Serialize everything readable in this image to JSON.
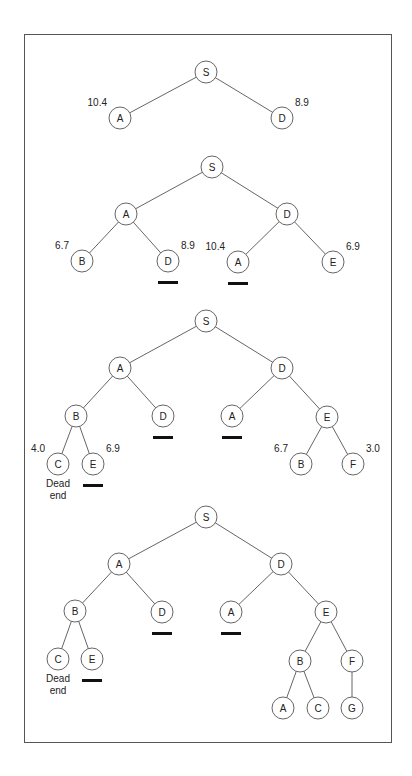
{
  "diagram": {
    "title": "",
    "frame": {
      "x": 24,
      "y": 34,
      "width": 368,
      "height": 709
    },
    "node_radius": 11,
    "trees": [
      {
        "id": "step-1",
        "nodes": [
          {
            "id": "t1-S",
            "label": "S",
            "x": 206,
            "y": 72
          },
          {
            "id": "t1-A",
            "label": "A",
            "x": 120,
            "y": 118,
            "cost": "10.4",
            "cost_side": "left"
          },
          {
            "id": "t1-D",
            "label": "D",
            "x": 282,
            "y": 118,
            "cost": "8.9",
            "cost_side": "right"
          }
        ],
        "edges": [
          [
            "t1-S",
            "t1-A"
          ],
          [
            "t1-S",
            "t1-D"
          ]
        ],
        "underlined": [],
        "notes": []
      },
      {
        "id": "step-2",
        "nodes": [
          {
            "id": "t2-S",
            "label": "S",
            "x": 212,
            "y": 167
          },
          {
            "id": "t2-A",
            "label": "A",
            "x": 126,
            "y": 214
          },
          {
            "id": "t2-D",
            "label": "D",
            "x": 287,
            "y": 214
          },
          {
            "id": "t2-AB",
            "label": "B",
            "x": 82,
            "y": 261,
            "cost": "6.7",
            "cost_side": "left"
          },
          {
            "id": "t2-AD",
            "label": "D",
            "x": 168,
            "y": 261,
            "cost": "8.9",
            "cost_side": "right"
          },
          {
            "id": "t2-DA",
            "label": "A",
            "x": 238,
            "y": 262,
            "cost": "10.4",
            "cost_side": "left"
          },
          {
            "id": "t2-DE",
            "label": "E",
            "x": 333,
            "y": 262,
            "cost": "6.9",
            "cost_side": "right"
          }
        ],
        "edges": [
          [
            "t2-S",
            "t2-A"
          ],
          [
            "t2-S",
            "t2-D"
          ],
          [
            "t2-A",
            "t2-AB"
          ],
          [
            "t2-A",
            "t2-AD"
          ],
          [
            "t2-D",
            "t2-DA"
          ],
          [
            "t2-D",
            "t2-DE"
          ]
        ],
        "underlined": [
          "t2-AD",
          "t2-DA"
        ],
        "notes": []
      },
      {
        "id": "step-3",
        "nodes": [
          {
            "id": "t3-S",
            "label": "S",
            "x": 206,
            "y": 321
          },
          {
            "id": "t3-A",
            "label": "A",
            "x": 120,
            "y": 368
          },
          {
            "id": "t3-D",
            "label": "D",
            "x": 282,
            "y": 368
          },
          {
            "id": "t3-AB",
            "label": "B",
            "x": 76,
            "y": 416
          },
          {
            "id": "t3-AD",
            "label": "D",
            "x": 163,
            "y": 416
          },
          {
            "id": "t3-DA",
            "label": "A",
            "x": 232,
            "y": 416
          },
          {
            "id": "t3-DE",
            "label": "E",
            "x": 327,
            "y": 417
          },
          {
            "id": "t3-ABC",
            "label": "C",
            "x": 58,
            "y": 464,
            "cost": "4.0",
            "cost_side": "left"
          },
          {
            "id": "t3-ABE",
            "label": "E",
            "x": 93,
            "y": 464,
            "cost": "6.9",
            "cost_side": "right"
          },
          {
            "id": "t3-DEB",
            "label": "B",
            "x": 301,
            "y": 464,
            "cost": "6.7",
            "cost_side": "left"
          },
          {
            "id": "t3-DEF",
            "label": "F",
            "x": 353,
            "y": 464,
            "cost": "3.0",
            "cost_side": "right"
          }
        ],
        "edges": [
          [
            "t3-S",
            "t3-A"
          ],
          [
            "t3-S",
            "t3-D"
          ],
          [
            "t3-A",
            "t3-AB"
          ],
          [
            "t3-A",
            "t3-AD"
          ],
          [
            "t3-D",
            "t3-DA"
          ],
          [
            "t3-D",
            "t3-DE"
          ],
          [
            "t3-AB",
            "t3-ABC"
          ],
          [
            "t3-AB",
            "t3-ABE"
          ],
          [
            "t3-DE",
            "t3-DEB"
          ],
          [
            "t3-DE",
            "t3-DEF"
          ]
        ],
        "underlined": [
          "t3-AD",
          "t3-DA",
          "t3-ABE"
        ],
        "notes": [
          {
            "node": "t3-ABC",
            "lines": [
              "Dead",
              "end"
            ]
          }
        ]
      },
      {
        "id": "step-4",
        "nodes": [
          {
            "id": "t4-S",
            "label": "S",
            "x": 206,
            "y": 517
          },
          {
            "id": "t4-A",
            "label": "A",
            "x": 119,
            "y": 564
          },
          {
            "id": "t4-D",
            "label": "D",
            "x": 281,
            "y": 564
          },
          {
            "id": "t4-AB",
            "label": "B",
            "x": 75,
            "y": 611
          },
          {
            "id": "t4-AD",
            "label": "D",
            "x": 162,
            "y": 612
          },
          {
            "id": "t4-DA",
            "label": "A",
            "x": 231,
            "y": 612
          },
          {
            "id": "t4-DE",
            "label": "E",
            "x": 326,
            "y": 612
          },
          {
            "id": "t4-ABC",
            "label": "C",
            "x": 58,
            "y": 659
          },
          {
            "id": "t4-ABE",
            "label": "E",
            "x": 92,
            "y": 659
          },
          {
            "id": "t4-DEB",
            "label": "B",
            "x": 300,
            "y": 661
          },
          {
            "id": "t4-DEF",
            "label": "F",
            "x": 352,
            "y": 661
          },
          {
            "id": "t4-DEBA",
            "label": "A",
            "x": 283,
            "y": 708
          },
          {
            "id": "t4-DEBC",
            "label": "C",
            "x": 318,
            "y": 708
          },
          {
            "id": "t4-DEFG",
            "label": "G",
            "x": 352,
            "y": 708
          }
        ],
        "edges": [
          [
            "t4-S",
            "t4-A"
          ],
          [
            "t4-S",
            "t4-D"
          ],
          [
            "t4-A",
            "t4-AB"
          ],
          [
            "t4-A",
            "t4-AD"
          ],
          [
            "t4-D",
            "t4-DA"
          ],
          [
            "t4-D",
            "t4-DE"
          ],
          [
            "t4-AB",
            "t4-ABC"
          ],
          [
            "t4-AB",
            "t4-ABE"
          ],
          [
            "t4-DE",
            "t4-DEB"
          ],
          [
            "t4-DE",
            "t4-DEF"
          ],
          [
            "t4-DEB",
            "t4-DEBA"
          ],
          [
            "t4-DEB",
            "t4-DEBC"
          ],
          [
            "t4-DEF",
            "t4-DEFG"
          ]
        ],
        "underlined": [
          "t4-AD",
          "t4-DA",
          "t4-ABE"
        ],
        "notes": [
          {
            "node": "t4-ABC",
            "lines": [
              "Dead",
              "end"
            ]
          }
        ]
      }
    ]
  },
  "colors": {
    "background": "#ffffff",
    "frame_border": "#555555",
    "edge": "#666666",
    "node_stroke": "#666666",
    "text": "#222222",
    "underline": "#111111"
  }
}
